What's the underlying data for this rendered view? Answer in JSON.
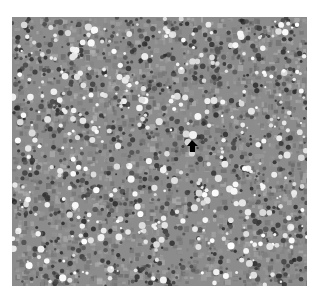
{
  "figure": {
    "type": "grayscale micrograph",
    "colors": {
      "page_background": "#ffffff",
      "tissue_base": "#8c8c8c",
      "dark_nuclei": "#3c3c3c",
      "light_vacuoles": "#f2f2f2",
      "arrow": "#000000"
    },
    "annotation": {
      "kind": "arrow",
      "direction": "up",
      "tip": [
        192,
        140
      ],
      "target_cell_center": [
        193,
        135
      ]
    }
  }
}
